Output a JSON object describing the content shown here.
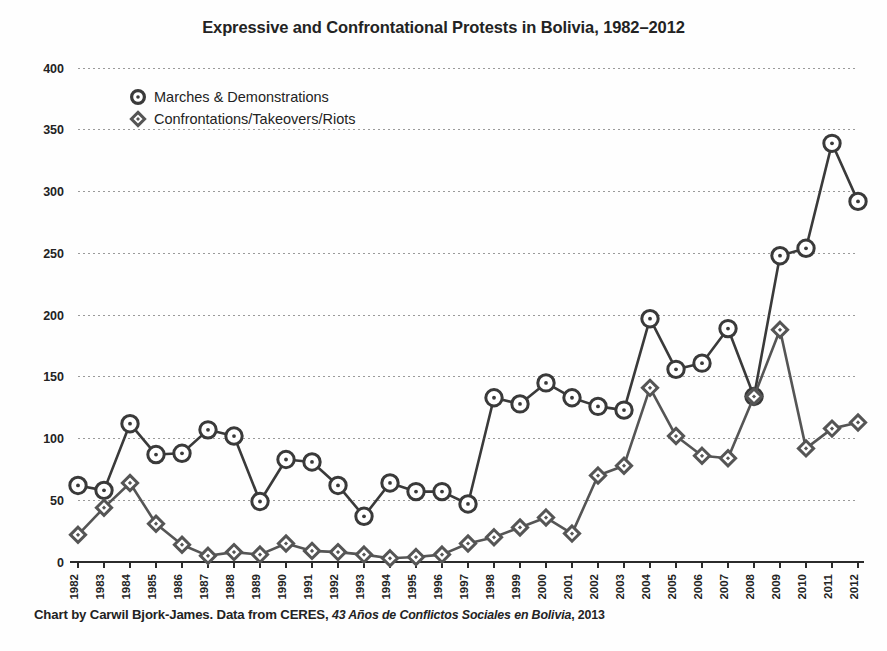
{
  "chart_data": {
    "type": "line",
    "title": "Expressive and Confrontational Protests in Bolivia, 1982–2012",
    "xlabel": "",
    "ylabel": "",
    "ylim": [
      0,
      400
    ],
    "ytick_step": 50,
    "yticks": [
      "0",
      "50",
      "100",
      "150",
      "200",
      "250",
      "300",
      "350",
      "400"
    ],
    "grid": true,
    "legend_position": "upper-left-inside",
    "categories": [
      "1982",
      "1983",
      "1984",
      "1985",
      "1986",
      "1987",
      "1988",
      "1989",
      "1990",
      "1991",
      "1992",
      "1993",
      "1994",
      "1995",
      "1996",
      "1997",
      "1998",
      "1999",
      "2000",
      "2001",
      "2002",
      "2003",
      "2004",
      "2005",
      "2006",
      "2007",
      "2008",
      "2009",
      "2010",
      "2011",
      "2012"
    ],
    "series": [
      {
        "name": "Marches & Demonstrations",
        "marker": "circle",
        "color": "#3a3a3a",
        "values": [
          62,
          58,
          112,
          87,
          88,
          107,
          102,
          49,
          83,
          81,
          62,
          37,
          64,
          57,
          57,
          47,
          133,
          128,
          145,
          133,
          126,
          123,
          197,
          156,
          161,
          189,
          134,
          248,
          254,
          339,
          292
        ]
      },
      {
        "name": "Confrontations/Takeovers/Riots",
        "marker": "diamond",
        "color": "#555555",
        "values": [
          22,
          44,
          64,
          31,
          14,
          5,
          8,
          6,
          15,
          9,
          8,
          6,
          3,
          4,
          6,
          15,
          20,
          28,
          36,
          23,
          70,
          78,
          141,
          102,
          86,
          84,
          134,
          188,
          92,
          108,
          113
        ]
      }
    ],
    "annotations": []
  },
  "caption": {
    "prefix": "Chart by Carwil Bjork-James. Data from CERES, ",
    "source_title": "43 Años de Conflictos Sociales en Bolivia",
    "separator": ", ",
    "year": "2013"
  },
  "legend": {
    "items": [
      {
        "label": "Marches & Demonstrations",
        "icon": "circle-marker-icon"
      },
      {
        "label": "Confrontations/Takeovers/Riots",
        "icon": "diamond-marker-icon"
      }
    ]
  },
  "colors": {
    "background": "#fefefe",
    "ink": "#232323",
    "series_primary": "#3a3a3a",
    "series_secondary": "#555555",
    "gridline": "#9a9a9a",
    "axis": "#2b2b2b"
  }
}
